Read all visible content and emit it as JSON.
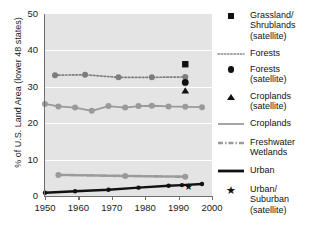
{
  "chart_data": {
    "type": "line",
    "title": "",
    "xlabel": "",
    "ylabel": "% of U.S. Land Area (lower 48 states)",
    "xlim": [
      1950,
      2000
    ],
    "ylim": [
      0,
      50
    ],
    "grid": true,
    "legend_position": "right",
    "x_ticks": [
      1950,
      1960,
      1970,
      1980,
      1990,
      2000
    ],
    "y_ticks": [
      0,
      10,
      20,
      30,
      40,
      50
    ],
    "series": [
      {
        "name": "Forests",
        "style": "dotted",
        "color": "#7d7d7d",
        "marker": "circle",
        "x": [
          1953,
          1962,
          1972,
          1982,
          1992
        ],
        "values": [
          33.2,
          33.3,
          32.6,
          32.6,
          32.7
        ]
      },
      {
        "name": "Croplands",
        "style": "solid",
        "color": "#9a9a9a",
        "marker": "circle",
        "x": [
          1950,
          1954,
          1959,
          1964,
          1969,
          1974,
          1978,
          1982,
          1987,
          1992,
          1997
        ],
        "values": [
          25.3,
          24.6,
          24.3,
          23.4,
          24.7,
          24.3,
          24.7,
          24.8,
          24.6,
          24.5,
          24.4
        ]
      },
      {
        "name": "Freshwater Wetlands",
        "style": "dash-dot",
        "color": "#9a9a9a",
        "marker": "circle",
        "x": [
          1954,
          1974,
          1992
        ],
        "values": [
          5.8,
          5.5,
          5.3
        ]
      },
      {
        "name": "Urban",
        "style": "solid",
        "color": "#111111",
        "marker": "circle",
        "x": [
          1950,
          1959,
          1969,
          1978,
          1987,
          1991,
          1997
        ],
        "values": [
          0.9,
          1.3,
          1.7,
          2.3,
          2.8,
          3.0,
          3.3
        ]
      }
    ],
    "points": [
      {
        "name": "Grassland/Shrublands (satellite)",
        "marker": "square",
        "color": "#111111",
        "x": 1992,
        "y": 36.2
      },
      {
        "name": "Forests (satellite)",
        "marker": "circle",
        "color": "#111111",
        "x": 1992,
        "y": 31.2
      },
      {
        "name": "Croplands (satellite)",
        "marker": "triangle",
        "color": "#111111",
        "x": 1992,
        "y": 28.9
      },
      {
        "name": "Urban/Suburban (satellite)",
        "marker": "star",
        "color": "#111111",
        "x": 1993,
        "y": 2.5
      }
    ]
  },
  "axis": {
    "y_title": "% of U.S. Land Area (lower 48 states)",
    "y_labels": [
      "0",
      "10",
      "20",
      "30",
      "40",
      "50"
    ],
    "x_labels": [
      "1950",
      "1960",
      "1970",
      "1980",
      "1990",
      "2000"
    ]
  },
  "legend": {
    "entries": [
      {
        "key": "square",
        "label": "Grassland/\nShrublands\n(satellite)"
      },
      {
        "key": "dotted",
        "label": "Forests"
      },
      {
        "key": "circle",
        "label": "Forests\n(satellite)"
      },
      {
        "key": "triangle",
        "label": "Croplands\n(satellite)"
      },
      {
        "key": "solid-gray",
        "label": "Croplands"
      },
      {
        "key": "dash-dot",
        "label": "Freshwater\nWetlands"
      },
      {
        "key": "solid-black",
        "label": "Urban"
      },
      {
        "key": "star",
        "label": "Urban/\nSuburban\n(satellite)"
      }
    ],
    "labels": {
      "grassland_shrublands_satellite": "Grassland/ Shrublands (satellite)",
      "forests": "Forests",
      "forests_satellite": "Forests (satellite)",
      "croplands_satellite": "Croplands (satellite)",
      "croplands": "Croplands",
      "freshwater_wetlands": "Freshwater Wetlands",
      "urban": "Urban",
      "urban_suburban_satellite": "Urban/ Suburban (satellite)"
    }
  },
  "colors": {
    "plot_background": "#e4e4e4",
    "gridline": "#ffffff",
    "axis": "#6f6f6f",
    "gray_series": "#9a9a9a",
    "dark_series": "#7d7d7d",
    "black_series": "#111111"
  }
}
